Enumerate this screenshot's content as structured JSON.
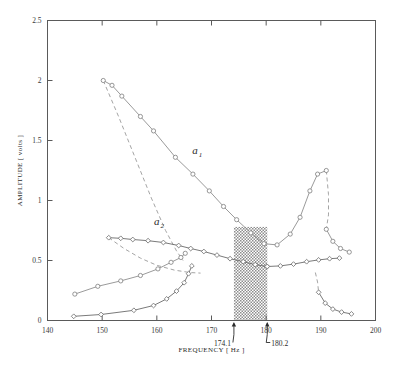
{
  "chart_data": {
    "type": "line",
    "title": "",
    "xlabel": "FREQUENCY [ Hz ]",
    "ylabel": "AMPLITUDE [ volts ]",
    "xlim": [
      140,
      200
    ],
    "ylim": [
      0,
      2.5
    ],
    "xticks": [
      140,
      150,
      160,
      170,
      180,
      190,
      200
    ],
    "xticklabels": [
      "140",
      "150",
      "160",
      "170",
      "180",
      "190",
      "200"
    ],
    "yticks": [
      0,
      0.5,
      1,
      1.5,
      2,
      2.5
    ],
    "yticklabels": [
      "0",
      "0.5",
      "1",
      "1.5",
      "2",
      "2.5"
    ],
    "grid": false,
    "legend_position": "inline-annotations",
    "annotations": [
      {
        "name": "lower-bifurcation-marker",
        "label": "174.1",
        "x": 174.1,
        "y": 0,
        "marker": "up-arrow"
      },
      {
        "name": "upper-bifurcation-marker",
        "label": "180.2",
        "x": 180.2,
        "y": 0,
        "marker": "up-arrow"
      }
    ],
    "shaded_region": {
      "name": "hysteresis-band",
      "x_start": 174.1,
      "x_end": 180.2,
      "y_start": 0,
      "y_end": 0.78,
      "pattern": "dotted-hatch",
      "color": "#9a9a9a"
    },
    "curve_labels": [
      {
        "name": "a1",
        "base": "a",
        "sub": "1",
        "x": 166.5,
        "y": 1.39
      },
      {
        "name": "a2",
        "base": "a",
        "sub": "2",
        "x": 159.5,
        "y": 0.8
      }
    ],
    "series": [
      {
        "name": "a1-upper-solid-branch",
        "style": "solid",
        "marker": "circle",
        "points": [
          [
            150.2,
            2.0
          ],
          [
            151.8,
            1.96
          ],
          [
            153.6,
            1.87
          ],
          [
            157.0,
            1.7
          ],
          [
            159.4,
            1.58
          ],
          [
            163.4,
            1.36
          ],
          [
            166.6,
            1.22
          ],
          [
            169.6,
            1.08
          ],
          [
            172.2,
            0.95
          ],
          [
            174.6,
            0.84
          ],
          [
            177.2,
            0.73
          ],
          [
            179.6,
            0.64
          ],
          [
            182.0,
            0.63
          ],
          [
            184.4,
            0.72
          ],
          [
            186.2,
            0.86
          ],
          [
            188.0,
            1.08
          ],
          [
            189.4,
            1.22
          ],
          [
            191.0,
            1.25
          ]
        ]
      },
      {
        "name": "a1-unstable-dashed-branch",
        "style": "dashed",
        "marker": "none",
        "points": [
          [
            150.2,
            2.0
          ],
          [
            153.0,
            1.7
          ],
          [
            156.0,
            1.36
          ],
          [
            159.0,
            1.02
          ],
          [
            161.6,
            0.75
          ],
          [
            163.6,
            0.58
          ],
          [
            164.8,
            0.5
          ]
        ]
      },
      {
        "name": "a1-right-descending-dashed-branch",
        "style": "dashed",
        "marker": "none",
        "points": [
          [
            191.0,
            1.25
          ],
          [
            191.4,
            1.05
          ],
          [
            191.4,
            0.88
          ],
          [
            191.0,
            0.76
          ]
        ]
      },
      {
        "name": "a1-right-tail-solid",
        "style": "solid",
        "marker": "circle",
        "points": [
          [
            191.0,
            0.76
          ],
          [
            192.2,
            0.66
          ],
          [
            193.6,
            0.6
          ],
          [
            195.2,
            0.57
          ]
        ]
      },
      {
        "name": "a2-upper-solid-branch",
        "style": "solid",
        "marker": "diamond",
        "points": [
          [
            151.2,
            0.69
          ],
          [
            153.4,
            0.685
          ],
          [
            155.6,
            0.675
          ],
          [
            158.4,
            0.665
          ],
          [
            161.2,
            0.65
          ],
          [
            164.0,
            0.625
          ],
          [
            166.2,
            0.6
          ],
          [
            168.6,
            0.575
          ],
          [
            171.0,
            0.545
          ],
          [
            173.4,
            0.515
          ],
          [
            175.8,
            0.49
          ],
          [
            178.0,
            0.465
          ],
          [
            180.2,
            0.45
          ]
        ]
      },
      {
        "name": "a2-descending-dashed-branch",
        "style": "dashed",
        "marker": "none",
        "points": [
          [
            151.2,
            0.69
          ],
          [
            154.0,
            0.6
          ],
          [
            157.0,
            0.52
          ],
          [
            160.0,
            0.46
          ],
          [
            163.2,
            0.42
          ],
          [
            166.0,
            0.4
          ],
          [
            168.0,
            0.395
          ]
        ]
      },
      {
        "name": "a2-right-solid-branch",
        "style": "solid",
        "marker": "diamond",
        "points": [
          [
            180.2,
            0.45
          ],
          [
            182.6,
            0.455
          ],
          [
            185.0,
            0.47
          ],
          [
            187.4,
            0.49
          ],
          [
            189.6,
            0.505
          ],
          [
            191.6,
            0.515
          ],
          [
            193.4,
            0.52
          ]
        ]
      },
      {
        "name": "lower-left-rising-solid-branch",
        "style": "solid",
        "marker": "circle",
        "points": [
          [
            145.0,
            0.22
          ],
          [
            149.2,
            0.285
          ],
          [
            153.4,
            0.33
          ],
          [
            157.0,
            0.375
          ],
          [
            160.2,
            0.43
          ],
          [
            162.6,
            0.485
          ],
          [
            164.4,
            0.525
          ],
          [
            165.2,
            0.56
          ]
        ]
      },
      {
        "name": "lower-left-baseline-solid-branch",
        "style": "solid",
        "marker": "diamond",
        "points": [
          [
            144.8,
            0.035
          ],
          [
            149.8,
            0.05
          ],
          [
            155.8,
            0.085
          ],
          [
            159.4,
            0.125
          ],
          [
            161.8,
            0.18
          ],
          [
            163.6,
            0.245
          ],
          [
            165.0,
            0.315
          ],
          [
            165.8,
            0.39
          ],
          [
            166.4,
            0.455
          ]
        ]
      },
      {
        "name": "lower-right-descending-solid-branch",
        "style": "solid",
        "marker": "diamond",
        "points": [
          [
            189.6,
            0.235
          ],
          [
            190.8,
            0.145
          ],
          [
            192.2,
            0.095
          ],
          [
            193.8,
            0.07
          ],
          [
            195.6,
            0.055
          ]
        ]
      },
      {
        "name": "lower-right-connector-dashed",
        "style": "dashed",
        "marker": "none",
        "points": [
          [
            189.0,
            0.4
          ],
          [
            189.4,
            0.32
          ],
          [
            189.6,
            0.235
          ]
        ]
      }
    ]
  }
}
